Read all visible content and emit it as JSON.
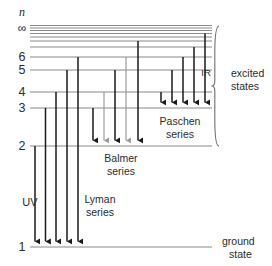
{
  "figure": {
    "background_color": "#ffffff",
    "level_line_color": "#8a8a8a",
    "transition_dark_color": "#1a1a1a",
    "transition_light_color": "#9b9b9b",
    "text_color": "#2b2b2b"
  },
  "axis": {
    "symbol": "n",
    "infinity_label": "∞",
    "level_labels": [
      "6",
      "5",
      "4",
      "3",
      "2",
      "1"
    ]
  },
  "annotations": {
    "uv": "UV",
    "ir": "IR",
    "lyman_line1": "Lyman",
    "lyman_line2": "series",
    "balmer_line1": "Balmer",
    "balmer_line2": "series",
    "paschen_line1": "Paschen",
    "paschen_line2": "series",
    "excited_line1": "excited",
    "excited_line2": "states",
    "ground_line1": "ground",
    "ground_line2": "state"
  },
  "chart_data": {
    "type": "diagram",
    "xlabel": "",
    "ylabel": "n",
    "levels": [
      {
        "n": "1",
        "label": "1",
        "y": 247,
        "x_start": 30,
        "x_end": 212,
        "labeled": true
      },
      {
        "n": "2",
        "label": "2",
        "y": 146,
        "x_start": 30,
        "x_end": 212,
        "labeled": true
      },
      {
        "n": "3",
        "label": "3",
        "y": 108,
        "x_start": 30,
        "x_end": 212,
        "labeled": true
      },
      {
        "n": "4",
        "label": "4",
        "y": 92,
        "x_start": 30,
        "x_end": 212,
        "labeled": true
      },
      {
        "n": "5",
        "label": "5",
        "y": 70,
        "x_start": 30,
        "x_end": 212,
        "labeled": true
      },
      {
        "n": "6",
        "label": "6",
        "y": 57,
        "x_start": 30,
        "x_end": 212,
        "labeled": true
      },
      {
        "n": "7",
        "label": "",
        "y": 47,
        "x_start": 30,
        "x_end": 212,
        "labeled": false
      },
      {
        "n": "8",
        "label": "",
        "y": 41,
        "x_start": 30,
        "x_end": 212,
        "labeled": false
      },
      {
        "n": "9",
        "label": "",
        "y": 37,
        "x_start": 30,
        "x_end": 212,
        "labeled": false
      },
      {
        "n": "10",
        "label": "",
        "y": 33.5,
        "x_start": 30,
        "x_end": 212,
        "labeled": false
      },
      {
        "n": "11",
        "label": "",
        "y": 30.5,
        "x_start": 30,
        "x_end": 212,
        "labeled": false
      },
      {
        "n": "12",
        "label": "",
        "y": 28,
        "x_start": 30,
        "x_end": 212,
        "labeled": false
      },
      {
        "n": "inf",
        "label": "",
        "y": 25.5,
        "x_start": 30,
        "x_end": 212,
        "labeled": false
      }
    ],
    "series": [
      {
        "name": "Lyman series",
        "region": "UV",
        "lower_level": 1,
        "lower_y": 247,
        "transitions": [
          {
            "from_n": 2,
            "x": 35,
            "y_top": 146,
            "y_bottom": 247,
            "shade": "dark"
          },
          {
            "from_n": 3,
            "x": 45.5,
            "y_top": 108,
            "y_bottom": 247,
            "shade": "dark"
          },
          {
            "from_n": 4,
            "x": 56,
            "y_top": 92,
            "y_bottom": 247,
            "shade": "dark"
          },
          {
            "from_n": 5,
            "x": 67,
            "y_top": 70,
            "y_bottom": 247,
            "shade": "dark"
          },
          {
            "from_n": 6,
            "x": 78,
            "y_top": 57,
            "y_bottom": 247,
            "shade": "dark"
          }
        ]
      },
      {
        "name": "Balmer series",
        "region": "visible",
        "lower_level": 2,
        "lower_y": 146,
        "transitions": [
          {
            "from_n": 3,
            "x": 93,
            "y_top": 108,
            "y_bottom": 146,
            "shade": "dark"
          },
          {
            "from_n": 4,
            "x": 104,
            "y_top": 92,
            "y_bottom": 146,
            "shade": "light"
          },
          {
            "from_n": 5,
            "x": 115,
            "y_top": 70,
            "y_bottom": 146,
            "shade": "dark"
          },
          {
            "from_n": 6,
            "x": 126,
            "y_top": 57,
            "y_bottom": 146,
            "shade": "light"
          },
          {
            "from_n": 0,
            "x": 138,
            "y_top": 41,
            "y_bottom": 146,
            "shade": "dark"
          }
        ]
      },
      {
        "name": "Paschen series",
        "region": "IR",
        "lower_level": 3,
        "lower_y": 108,
        "transitions": [
          {
            "from_n": 4,
            "x": 161,
            "y_top": 92,
            "y_bottom": 108,
            "shade": "dark"
          },
          {
            "from_n": 5,
            "x": 172,
            "y_top": 70,
            "y_bottom": 108,
            "shade": "dark"
          },
          {
            "from_n": 6,
            "x": 183,
            "y_top": 57,
            "y_bottom": 108,
            "shade": "dark"
          },
          {
            "from_n": 7,
            "x": 194,
            "y_top": 47,
            "y_bottom": 108,
            "shade": "dark"
          },
          {
            "from_n": 0,
            "x": 205,
            "y_top": 33.5,
            "y_bottom": 108,
            "shade": "dark"
          }
        ]
      }
    ],
    "brace": {
      "label": "excited states",
      "x": 219,
      "y_top": 26,
      "y_bottom": 146
    },
    "ground_marker": {
      "label": "ground state",
      "y": 247
    }
  }
}
